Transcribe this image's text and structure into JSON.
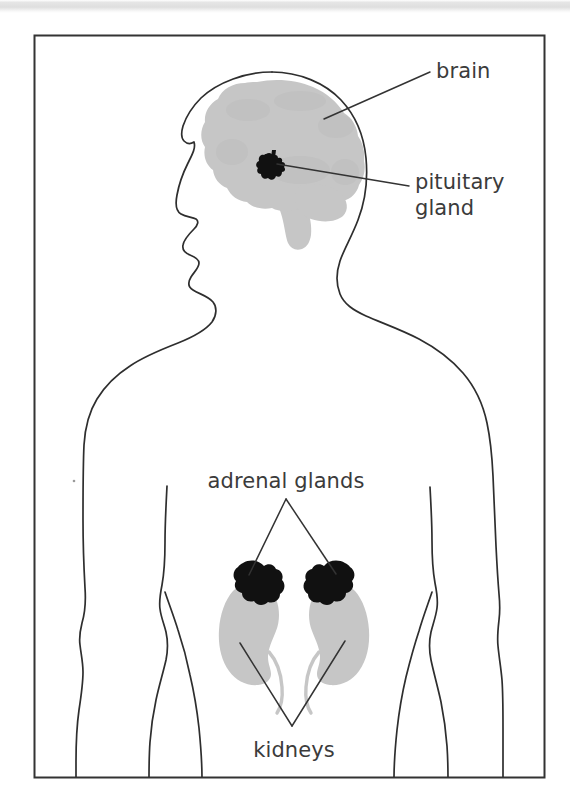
{
  "figure": {
    "name": "human-endocrine-glands-diagram",
    "border_color": "#333333",
    "background_color": "#ffffff"
  },
  "colors": {
    "outline": "#2e2e2e",
    "organ_light_gray": "#c6c6c6",
    "organ_dark": "#111111",
    "label_text": "#3b3b3b",
    "leader_line": "#333333",
    "scan_band": "#dedede"
  },
  "labels": [
    {
      "id": "brain",
      "text": "brain",
      "x": 436,
      "y": 78,
      "anchor": "start",
      "lines": [
        "brain"
      ]
    },
    {
      "id": "pituitary-gland",
      "text": "pituitary gland",
      "x": 415,
      "y": 189,
      "anchor": "start",
      "lines": [
        "pituitary",
        "gland"
      ]
    },
    {
      "id": "adrenal-glands",
      "text": "adrenal glands",
      "x": 286,
      "y": 488,
      "anchor": "middle",
      "lines": [
        "adrenal glands"
      ]
    },
    {
      "id": "kidneys",
      "text": "kidneys",
      "x": 294,
      "y": 757,
      "anchor": "middle",
      "lines": [
        "kidneys"
      ]
    }
  ],
  "organs": [
    {
      "id": "brain",
      "label": "brain",
      "fill": "#c6c6c6"
    },
    {
      "id": "brainstem",
      "label": "brain stem",
      "fill": "#c6c6c6"
    },
    {
      "id": "pituitary-gland",
      "label": "pituitary gland",
      "fill": "#111111"
    },
    {
      "id": "kidney-left",
      "label": "left kidney",
      "fill": "#c6c6c6"
    },
    {
      "id": "kidney-right",
      "label": "right kidney",
      "fill": "#c6c6c6"
    },
    {
      "id": "adrenal-gland-left",
      "label": "left adrenal gland",
      "fill": "#111111"
    },
    {
      "id": "adrenal-gland-right",
      "label": "right adrenal gland",
      "fill": "#111111"
    }
  ],
  "leader_lines": [
    {
      "id": "brain-leader",
      "from_label": "brain",
      "to_organ": "brain"
    },
    {
      "id": "pituitary-leader",
      "from_label": "pituitary-gland",
      "to_organ": "pituitary-gland"
    },
    {
      "id": "adrenal-leader-left",
      "from_label": "adrenal-glands",
      "to_organ": "adrenal-gland-left"
    },
    {
      "id": "adrenal-leader-right",
      "from_label": "adrenal-glands",
      "to_organ": "adrenal-gland-right"
    },
    {
      "id": "kidney-leader-left",
      "from_label": "kidneys",
      "to_organ": "kidney-left"
    },
    {
      "id": "kidney-leader-right",
      "from_label": "kidneys",
      "to_organ": "kidney-right"
    }
  ]
}
